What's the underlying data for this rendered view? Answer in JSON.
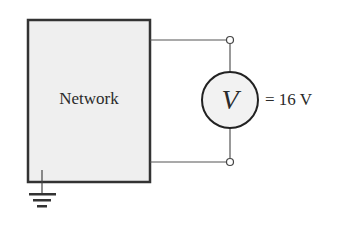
{
  "diagram": {
    "network_label": "Network",
    "meter_symbol": "V",
    "reading": "= 16 V",
    "colors": {
      "box_fill": "#efefef",
      "stroke": "#333333",
      "meter_fill": "#f2f2f2"
    }
  }
}
